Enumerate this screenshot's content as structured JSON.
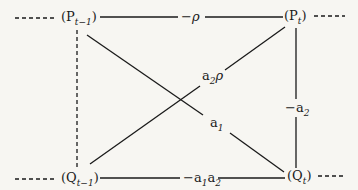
{
  "nodes": {
    "p_prev": {
      "label": "P",
      "sub": "t−1"
    },
    "p_curr": {
      "label": "P",
      "sub": "t"
    },
    "q_prev": {
      "label": "Q",
      "sub": "t−1"
    },
    "q_curr": {
      "label": "Q",
      "sub": "t"
    }
  },
  "edges": {
    "top": {
      "label": "−ρ"
    },
    "right": {
      "label": "−a",
      "sub": "2"
    },
    "bottom": {
      "label": "a",
      "sub1": "1",
      "mid": "a",
      "sub2": "2"
    },
    "diag_down": {
      "label": "a",
      "sub": "1"
    },
    "diag_up": {
      "label": "a",
      "sub": "2",
      "tail": "ρ"
    }
  },
  "colors": {
    "ink": "#1a1a1a",
    "paper": "#f7f6f2"
  }
}
